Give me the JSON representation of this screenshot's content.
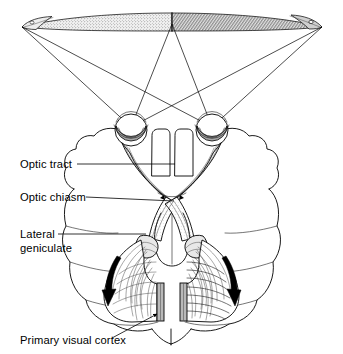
{
  "figure": {
    "width": 343,
    "height": 354,
    "background_color": "#ffffff",
    "ink_color": "#000000"
  },
  "labels": [
    {
      "id": "optic-tract",
      "text": "Optic tract",
      "text_x": 20,
      "text_y": 168,
      "leader": "M 77 164 L 175 164"
    },
    {
      "id": "optic-chiasm",
      "text": "Optic chiasm",
      "text_x": 20,
      "text_y": 201,
      "leader": "M 86 197 L 174 201"
    },
    {
      "id": "lateral-geniculate",
      "text": "Lateral",
      "text_x": 20,
      "text_y": 238,
      "leader": "M 58 234 L 146 234"
    },
    {
      "id": "lateral-geniculate-line2",
      "text": "geniculate",
      "text_x": 20,
      "text_y": 252,
      "leader": ""
    },
    {
      "id": "primary-visual-cortex",
      "text": "Primary visual cortex",
      "text_x": 20,
      "text_y": 344,
      "leader": "M 115 338 L 158 314"
    }
  ],
  "visual_field_bar": {
    "name": "visual-field-stimulus-bar",
    "left_tip_x": 22,
    "right_tip_x": 322,
    "center_x": 172,
    "center_y": 22,
    "left_half_shading": "fine-stipple",
    "right_half_shading": "dense-hatch",
    "left_half_color": "#d8d8d8",
    "right_half_color": "#a8a8a8"
  },
  "eyes": [
    {
      "id": "left-eye",
      "node_x": 131,
      "node_y": 127
    },
    {
      "id": "right-eye",
      "node_x": 212,
      "node_y": 127
    }
  ],
  "rays": [
    {
      "from": "left-eye",
      "to_x": 22,
      "to_y": 27
    },
    {
      "from": "left-eye",
      "to_x": 172,
      "to_y": 24
    },
    {
      "from": "left-eye",
      "to_x": 322,
      "to_y": 27
    },
    {
      "from": "right-eye",
      "to_x": 22,
      "to_y": 27
    },
    {
      "from": "right-eye",
      "to_x": 172,
      "to_y": 24
    },
    {
      "from": "right-eye",
      "to_x": 322,
      "to_y": 27
    }
  ],
  "chiasm": {
    "name": "optic-chiasm-crossing",
    "x": 172,
    "y": 201
  },
  "radiation_arrows": [
    {
      "id": "left-radiation-arrow",
      "direction": "down-left"
    },
    {
      "id": "right-radiation-arrow",
      "direction": "down-right"
    }
  ],
  "cortex_strips": [
    {
      "id": "left-primary-visual-cortex-strip",
      "x": 157,
      "y": 283,
      "w": 7,
      "h": 38
    },
    {
      "id": "right-primary-visual-cortex-strip",
      "x": 180,
      "y": 283,
      "w": 7,
      "h": 38
    }
  ]
}
